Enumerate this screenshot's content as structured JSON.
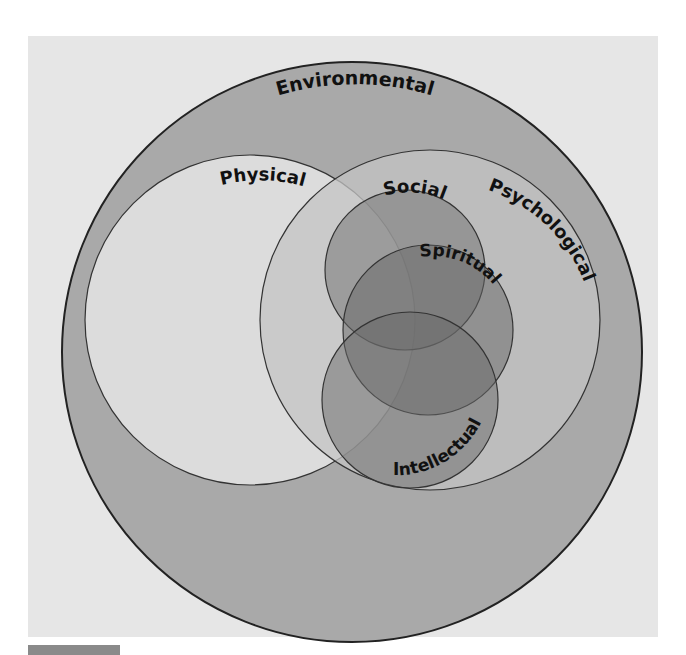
{
  "diagram": {
    "type": "venn",
    "colors": {
      "page_bg": "#ffffff",
      "panel_bg": "#e6e6e6",
      "tab": "#8a8a8a",
      "environmental_fill": "#a9a9a9",
      "physical_fill": "#dcdcdc",
      "psychological_fill": "#c4c4c4",
      "inner_fill": "#7a7a7a",
      "stroke": "#222222",
      "text": "#111111"
    },
    "circles": [
      {
        "id": "environmental",
        "label": "Environmental"
      },
      {
        "id": "physical",
        "label": "Physical"
      },
      {
        "id": "psychological",
        "label": "Psychological"
      },
      {
        "id": "social",
        "label": "Social"
      },
      {
        "id": "spiritual",
        "label": "Spiritual"
      },
      {
        "id": "intellectual",
        "label": "Intellectual"
      }
    ]
  }
}
